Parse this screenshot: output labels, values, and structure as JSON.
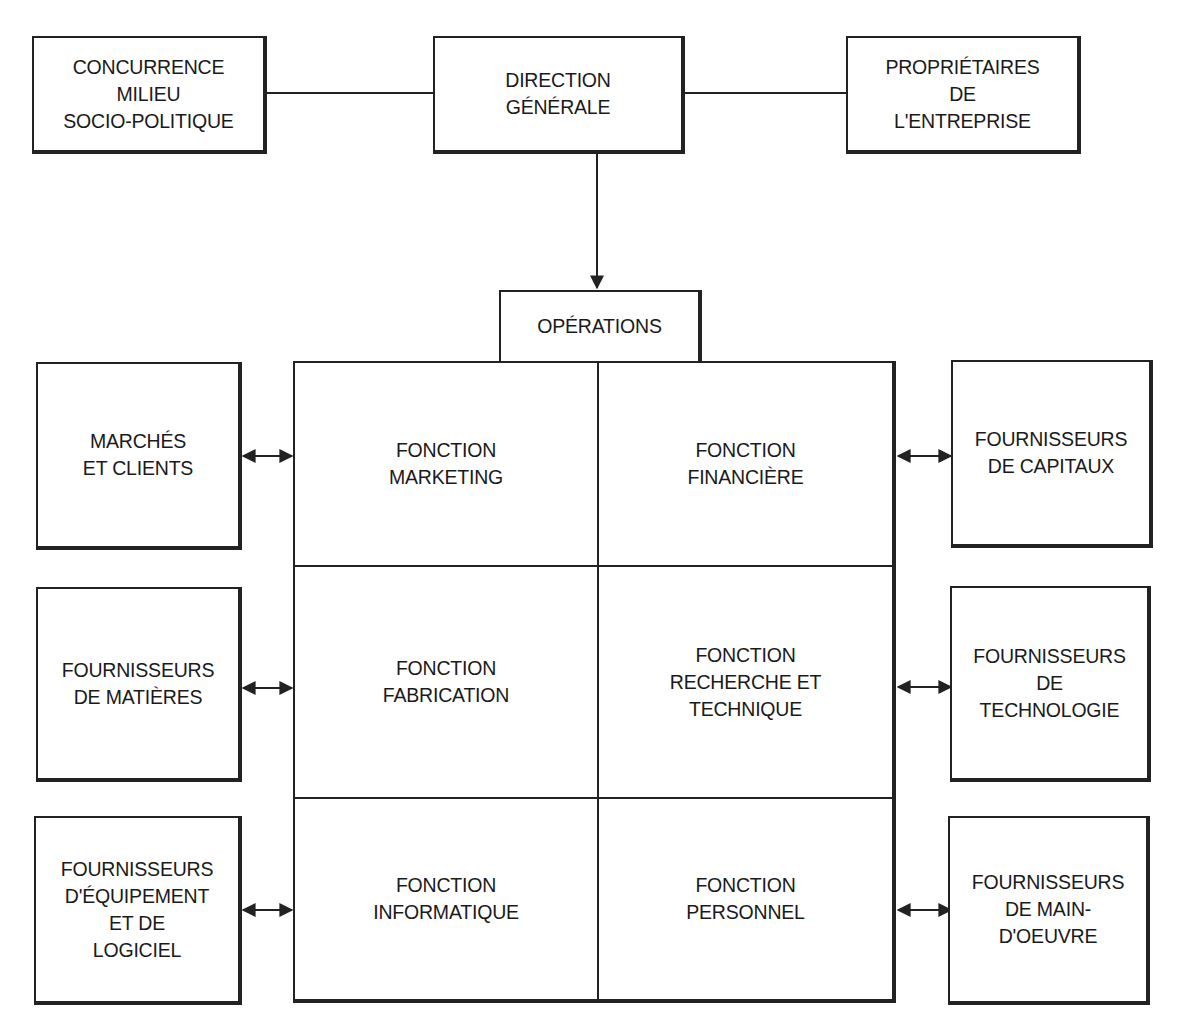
{
  "diagram": {
    "top": {
      "environment": "CONCURRENCE\nMILIEU\nSOCIO-POLITIQUE",
      "management": "DIRECTION\nGÉNÉRALE",
      "owners": "PROPRIÉTAIRES\nDE\nL'ENTREPRISE"
    },
    "operations_label": "OPÉRATIONS",
    "functions": [
      {
        "id": "marketing",
        "label": "FONCTION\nMARKETING"
      },
      {
        "id": "finance",
        "label": "FONCTION\nFINANCIÈRE"
      },
      {
        "id": "manufacturing",
        "label": "FONCTION\nFABRICATION"
      },
      {
        "id": "research",
        "label": "FONCTION\nRECHERCHE ET\nTECHNIQUE"
      },
      {
        "id": "it",
        "label": "FONCTION\nINFORMATIQUE"
      },
      {
        "id": "personnel",
        "label": "FONCTION\nPERSONNEL"
      }
    ],
    "left_partners": [
      {
        "id": "markets",
        "label": "MARCHÉS\nET CLIENTS"
      },
      {
        "id": "materials",
        "label": "FOURNISSEURS\nDE MATIÈRES"
      },
      {
        "id": "equipment",
        "label": "FOURNISSEURS\nD'ÉQUIPEMENT\nET DE\nLOGICIEL"
      }
    ],
    "right_partners": [
      {
        "id": "capital",
        "label": "FOURNISSEURS\nDE CAPITAUX"
      },
      {
        "id": "technology",
        "label": "FOURNISSEURS\nDE\nTECHNOLOGIE"
      },
      {
        "id": "labour",
        "label": "FOURNISSEURS\nDE MAIN-\nD'OEUVRE"
      }
    ],
    "connectors": {
      "environment_to_management": "line",
      "management_to_owners": "line",
      "management_to_operations": "arrow-down",
      "partners_to_functions": "bidirectional-arrow"
    }
  }
}
